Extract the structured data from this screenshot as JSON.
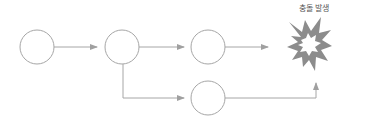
{
  "diagram": {
    "title_label": "충돌 발생",
    "colors": {
      "stroke": "#a6a6a6",
      "arrow": "#a0a0a0",
      "explosion": "#8c8c8c",
      "text": "#555555"
    },
    "nodes": [
      {
        "id": "node-1",
        "cx": 37,
        "cy": 47,
        "r": 17
      },
      {
        "id": "node-2",
        "cx": 122,
        "cy": 47,
        "r": 17
      },
      {
        "id": "node-3",
        "cx": 208,
        "cy": 47,
        "r": 17
      },
      {
        "id": "node-4",
        "cx": 208,
        "cy": 98,
        "r": 17
      }
    ],
    "edges": [
      {
        "from": "node-1",
        "to": "node-2"
      },
      {
        "from": "node-2",
        "to": "node-3"
      },
      {
        "from": "node-2",
        "to": "node-4"
      },
      {
        "from": "node-3",
        "to": "collision"
      },
      {
        "from": "node-4",
        "to": "collision"
      }
    ],
    "collision": {
      "icon": "explosion-icon",
      "cx": 310,
      "cy": 45
    }
  }
}
